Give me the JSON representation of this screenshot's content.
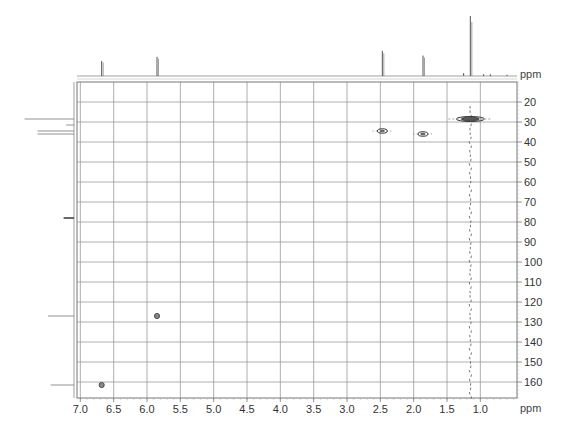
{
  "chart_data": {
    "type": "heatmap",
    "subtype": "2D NMR HSQC/HMQC correlation spectrum (contour)",
    "title": "",
    "xlabel": "ppm",
    "ylabel": "ppm",
    "x_axis": {
      "label": "ppm",
      "range": [
        7.05,
        0.45
      ],
      "reversed": true,
      "ticks": [
        7.0,
        6.5,
        6.0,
        5.5,
        5.0,
        4.5,
        4.0,
        3.5,
        3.0,
        2.5,
        2.0,
        1.5,
        1.0
      ],
      "tick_labels": [
        "7.0",
        "6.5",
        "6.0",
        "5.5",
        "5.0",
        "4.5",
        "4.0",
        "3.5",
        "3.0",
        "2.5",
        "2.0",
        "1.5",
        "1.0"
      ]
    },
    "y_axis": {
      "label": "ppm",
      "position": "right",
      "range": [
        10,
        168
      ],
      "reversed": true,
      "ticks": [
        20,
        30,
        40,
        50,
        60,
        70,
        80,
        90,
        100,
        110,
        120,
        130,
        140,
        150,
        160
      ],
      "tick_labels": [
        "20",
        "30",
        "40",
        "50",
        "60",
        "70",
        "80",
        "90",
        "100",
        "110",
        "120",
        "130",
        "140",
        "150",
        "160"
      ]
    },
    "grid": true,
    "legend": null,
    "cross_peaks": [
      {
        "x_ppm": 6.68,
        "y_ppm": 161.5,
        "size": "small",
        "label": "aromatic/olefinic CH"
      },
      {
        "x_ppm": 5.85,
        "y_ppm": 127.0,
        "size": "small",
        "label": "olefinic CH"
      },
      {
        "x_ppm": 2.47,
        "y_ppm": 34.5,
        "size": "medium",
        "label": "CH2/CH3"
      },
      {
        "x_ppm": 1.86,
        "y_ppm": 36.0,
        "size": "medium",
        "label": "CH2"
      },
      {
        "x_ppm": 1.15,
        "y_ppm": 28.5,
        "size": "large",
        "label": "CH3 (tBu)"
      }
    ],
    "t1_noise_trace": {
      "x_ppm": 1.15,
      "y_from": 22,
      "y_to": 168
    },
    "top_projection_1H": {
      "peaks": [
        {
          "ppm": 6.68,
          "height": 0.25
        },
        {
          "ppm": 5.85,
          "height": 0.32
        },
        {
          "ppm": 2.47,
          "height": 0.42
        },
        {
          "ppm": 1.86,
          "height": 0.34
        },
        {
          "ppm": 1.15,
          "height": 1.0
        },
        {
          "ppm": 1.25,
          "height": 0.05
        },
        {
          "ppm": 0.95,
          "height": 0.03
        },
        {
          "ppm": 0.85,
          "height": 0.03
        },
        {
          "ppm": 0.6,
          "height": 0.02
        }
      ]
    },
    "left_projection_13C": {
      "peaks": [
        {
          "ppm": 28.5,
          "length": 0.95
        },
        {
          "ppm": 31.5,
          "length": 0.15
        },
        {
          "ppm": 34.5,
          "length": 0.7
        },
        {
          "ppm": 36.0,
          "length": 0.7
        },
        {
          "ppm": 78.0,
          "length": 0.2,
          "thick": true
        },
        {
          "ppm": 127.0,
          "length": 0.5
        },
        {
          "ppm": 161.5,
          "length": 0.45
        }
      ]
    }
  },
  "axes": {
    "x_unit": "ppm",
    "y_unit": "ppm"
  },
  "colors": {
    "grid": "#9a9a9a",
    "frame": "#777777",
    "trace": "#555555",
    "peak": "#333333",
    "text": "#333333"
  }
}
